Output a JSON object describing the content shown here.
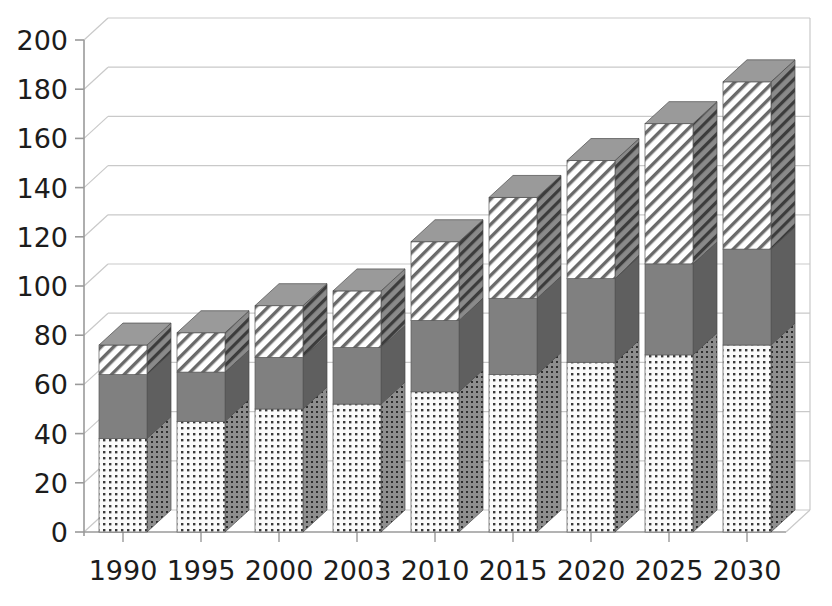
{
  "chart_data": {
    "type": "bar",
    "subtype": "stacked-3d-column",
    "title": "",
    "xlabel": "",
    "ylabel": "",
    "categories": [
      "1990",
      "1995",
      "2000",
      "2003",
      "2010",
      "2015",
      "2020",
      "2025",
      "2030"
    ],
    "series": [
      {
        "name": "series-1-dotted",
        "pattern": "dotted",
        "color": "#f2f2f2",
        "values": [
          38,
          45,
          50,
          52,
          57,
          64,
          69,
          72,
          76
        ]
      },
      {
        "name": "series-2-solid-gray",
        "pattern": "solid",
        "color": "#808080",
        "values": [
          26,
          20,
          21,
          23,
          29,
          31,
          34,
          37,
          39
        ]
      },
      {
        "name": "series-3-hatched",
        "pattern": "diagonal-hatch",
        "color": "#ffffff",
        "values": [
          12,
          16,
          21,
          23,
          32,
          41,
          48,
          57,
          68
        ]
      }
    ],
    "totals": [
      76,
      81,
      92,
      98,
      118,
      136,
      151,
      166,
      183
    ],
    "ylim": [
      0,
      200
    ],
    "y_ticks": [
      0,
      20,
      40,
      60,
      80,
      100,
      120,
      140,
      160,
      180,
      200
    ],
    "y_tick_labels": [
      "0",
      "20",
      "40",
      "60",
      "80",
      "100",
      "120",
      "140",
      "160",
      "180",
      "200"
    ],
    "grid": true,
    "legend": false,
    "legend_position": "none"
  },
  "axis": {
    "y_axis_name": "value-axis",
    "x_axis_name": "category-axis"
  },
  "colors": {
    "axis_line": "#9a9a9a",
    "grid_line": "#c9c9c9",
    "tick_text": "#1c1c1c",
    "bar_side": "#6e6e6e",
    "bar_top": "#8a8a8a",
    "dotted_fill": "#fafafa",
    "dotted_dot": "#3a3a3a",
    "solid_fill": "#808080",
    "hatch_fill": "#ffffff",
    "hatch_line": "#555555",
    "plot_background": "#ffffff"
  }
}
